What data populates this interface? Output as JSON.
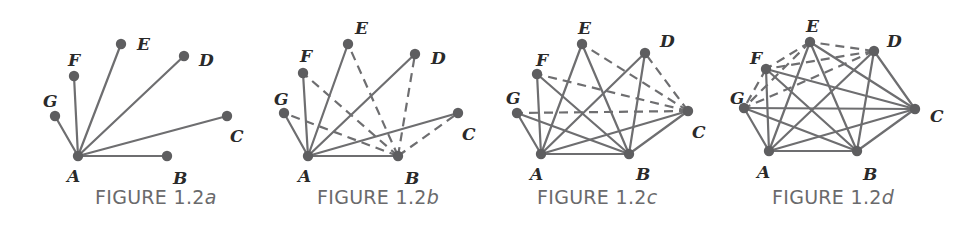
{
  "colors": {
    "edge": "#6e6e70",
    "node": "#5e5e60",
    "label": "#2a2a2a",
    "caption": "#6a6a6c",
    "background": "#ffffff"
  },
  "figures": [
    {
      "id": "a",
      "caption_prefix": "FIGURE 1.2",
      "caption_suffix": "a",
      "caption_pos": [
        95,
        204
      ],
      "nodes": {
        "A": {
          "x": 78,
          "y": 156,
          "lx": 67,
          "ly": 182
        },
        "B": {
          "x": 167,
          "y": 156,
          "lx": 173,
          "ly": 184
        },
        "C": {
          "x": 227,
          "y": 116,
          "lx": 230,
          "ly": 142
        },
        "D": {
          "x": 184,
          "y": 56,
          "lx": 199,
          "ly": 66
        },
        "E": {
          "x": 121,
          "y": 44,
          "lx": 137,
          "ly": 50
        },
        "F": {
          "x": 74,
          "y": 76,
          "lx": 68,
          "ly": 66
        },
        "G": {
          "x": 55,
          "y": 116,
          "lx": 43,
          "ly": 107
        }
      },
      "solid_edges": [
        [
          "A",
          "B"
        ],
        [
          "A",
          "C"
        ],
        [
          "A",
          "D"
        ],
        [
          "A",
          "E"
        ],
        [
          "A",
          "F"
        ],
        [
          "A",
          "G"
        ]
      ],
      "dashed_edges": []
    },
    {
      "id": "b",
      "caption_prefix": "FIGURE 1.2",
      "caption_suffix": "b",
      "caption_pos": [
        317,
        204
      ],
      "nodes": {
        "A": {
          "x": 308,
          "y": 156,
          "lx": 298,
          "ly": 182
        },
        "B": {
          "x": 398,
          "y": 156,
          "lx": 405,
          "ly": 184
        },
        "C": {
          "x": 458,
          "y": 113,
          "lx": 462,
          "ly": 140
        },
        "D": {
          "x": 415,
          "y": 54,
          "lx": 431,
          "ly": 64
        },
        "E": {
          "x": 348,
          "y": 44,
          "lx": 355,
          "ly": 34
        },
        "F": {
          "x": 303,
          "y": 73,
          "lx": 300,
          "ly": 62
        },
        "G": {
          "x": 284,
          "y": 113,
          "lx": 274,
          "ly": 105
        }
      },
      "solid_edges": [
        [
          "A",
          "B"
        ],
        [
          "A",
          "C"
        ],
        [
          "A",
          "D"
        ],
        [
          "A",
          "E"
        ],
        [
          "A",
          "F"
        ],
        [
          "A",
          "G"
        ]
      ],
      "dashed_edges": [
        [
          "B",
          "C"
        ],
        [
          "B",
          "D"
        ],
        [
          "B",
          "E"
        ],
        [
          "B",
          "F"
        ],
        [
          "B",
          "G"
        ]
      ]
    },
    {
      "id": "c",
      "caption_prefix": "FIGURE 1.2",
      "caption_suffix": "c",
      "caption_pos": [
        537,
        204
      ],
      "nodes": {
        "A": {
          "x": 541,
          "y": 154,
          "lx": 530,
          "ly": 180
        },
        "B": {
          "x": 629,
          "y": 154,
          "lx": 636,
          "ly": 180
        },
        "C": {
          "x": 688,
          "y": 111,
          "lx": 692,
          "ly": 138
        },
        "D": {
          "x": 645,
          "y": 53,
          "lx": 660,
          "ly": 47
        },
        "E": {
          "x": 582,
          "y": 44,
          "lx": 578,
          "ly": 34
        },
        "F": {
          "x": 537,
          "y": 74,
          "lx": 536,
          "ly": 66
        },
        "G": {
          "x": 517,
          "y": 113,
          "lx": 506,
          "ly": 104
        }
      },
      "solid_edges": [
        [
          "A",
          "B"
        ],
        [
          "A",
          "C"
        ],
        [
          "A",
          "D"
        ],
        [
          "A",
          "E"
        ],
        [
          "A",
          "F"
        ],
        [
          "A",
          "G"
        ],
        [
          "B",
          "C"
        ],
        [
          "B",
          "D"
        ],
        [
          "B",
          "E"
        ],
        [
          "B",
          "F"
        ],
        [
          "B",
          "G"
        ]
      ],
      "dashed_edges": [
        [
          "C",
          "D"
        ],
        [
          "C",
          "E"
        ],
        [
          "C",
          "F"
        ],
        [
          "C",
          "G"
        ]
      ]
    },
    {
      "id": "d",
      "caption_prefix": "FIGURE 1.2",
      "caption_suffix": "d",
      "caption_pos": [
        772,
        204
      ],
      "nodes": {
        "A": {
          "x": 769,
          "y": 151,
          "lx": 757,
          "ly": 178
        },
        "B": {
          "x": 857,
          "y": 151,
          "lx": 863,
          "ly": 180
        },
        "C": {
          "x": 915,
          "y": 109,
          "lx": 930,
          "ly": 122
        },
        "D": {
          "x": 874,
          "y": 51,
          "lx": 887,
          "ly": 47
        },
        "E": {
          "x": 810,
          "y": 42,
          "lx": 806,
          "ly": 32
        },
        "F": {
          "x": 766,
          "y": 69,
          "lx": 750,
          "ly": 64
        },
        "G": {
          "x": 744,
          "y": 108,
          "lx": 730,
          "ly": 104
        }
      },
      "solid_edges": [
        [
          "A",
          "B"
        ],
        [
          "A",
          "C"
        ],
        [
          "A",
          "D"
        ],
        [
          "A",
          "E"
        ],
        [
          "A",
          "F"
        ],
        [
          "A",
          "G"
        ],
        [
          "B",
          "C"
        ],
        [
          "B",
          "D"
        ],
        [
          "B",
          "E"
        ],
        [
          "B",
          "F"
        ],
        [
          "B",
          "G"
        ],
        [
          "C",
          "D"
        ],
        [
          "C",
          "E"
        ],
        [
          "C",
          "F"
        ],
        [
          "C",
          "G"
        ]
      ],
      "dashed_edges": [
        [
          "D",
          "E"
        ],
        [
          "D",
          "F"
        ],
        [
          "D",
          "G"
        ],
        [
          "E",
          "F"
        ],
        [
          "E",
          "G"
        ],
        [
          "F",
          "G"
        ]
      ]
    }
  ]
}
